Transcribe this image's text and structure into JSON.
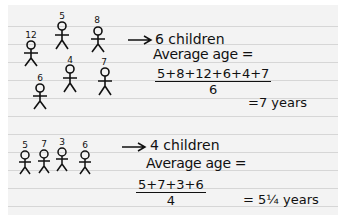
{
  "group1": {
    "children": [
      {
        "age": "12"
      },
      {
        "age": "5"
      },
      {
        "age": "8"
      },
      {
        "age": "6"
      },
      {
        "age": "4"
      },
      {
        "age": "7"
      }
    ],
    "arrow_label": "6 children",
    "average_label": "Average age =",
    "numerator": "5+8+12+6+4+7",
    "denominator": "6",
    "result": "=7 years"
  },
  "group2": {
    "children": [
      {
        "age": "5"
      },
      {
        "age": "7"
      },
      {
        "age": "3"
      },
      {
        "age": "6"
      }
    ],
    "arrow_label": "4 children",
    "average_label": "Average age =",
    "numerator": "5+7+3+6",
    "denominator": "4",
    "result": "= 5¼ years"
  },
  "colors": {
    "ink": "#111111",
    "paper": "#f3f3f3",
    "rule": "#d6d6d6"
  }
}
